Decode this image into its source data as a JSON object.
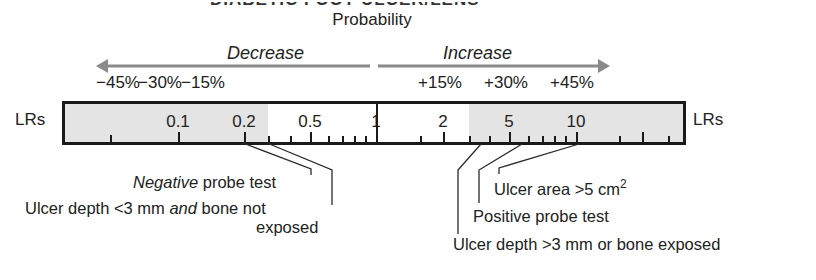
{
  "header": {
    "title_partial": "DIABETIC FOOT ULCER/LENS",
    "subtitle": "Probability"
  },
  "direction": {
    "decrease_label": "Decrease",
    "increase_label": "Increase",
    "arrow_color": "#8a8a8a"
  },
  "percent_labels": {
    "decrease": [
      "−45%",
      "−30%",
      "−15%"
    ],
    "increase": [
      "+15%",
      "+30%",
      "+45%"
    ]
  },
  "scale": {
    "left_label": "LRs",
    "right_label": "LRs",
    "shaded_color": "#e4e4e4",
    "ticks": [
      "0.1",
      "0.2",
      "0.5",
      "1",
      "2",
      "5",
      "10"
    ]
  },
  "findings": [
    {
      "label_italic": "Negative",
      "label_rest": " probe test"
    },
    {
      "label_pre": "Ulcer depth <3 mm ",
      "label_italic": "and",
      "label_post": " bone not",
      "label_line2": "exposed"
    },
    {
      "label": "Ulcer area >5 cm",
      "superscript": "2"
    },
    {
      "label": "Positive probe test"
    },
    {
      "label": "Ulcer depth >3 mm or bone exposed"
    }
  ]
}
